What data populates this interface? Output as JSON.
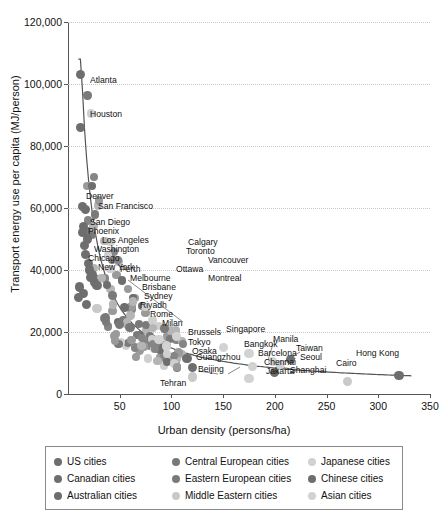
{
  "chart_data": {
    "type": "scatter",
    "title": "",
    "xlabel": "Urban density (persons/ha)",
    "ylabel": "Transport energy use per capita (MJ/person)",
    "xlim": [
      0,
      350
    ],
    "ylim": [
      0,
      120000
    ],
    "xticks": [
      "50",
      "100",
      "150",
      "200",
      "250",
      "300",
      "350"
    ],
    "xtick_values": [
      50,
      100,
      150,
      200,
      250,
      300,
      350
    ],
    "yticks": [
      "0",
      "20,000",
      "40,000",
      "60,000",
      "80,000",
      "100,000",
      "120,000"
    ],
    "ytick_values": [
      0,
      20000,
      40000,
      60000,
      80000,
      100000,
      120000
    ],
    "grid": "horizontal-dotted",
    "legend_position": "below-plot",
    "trendline": "decaying power curve from (10, 105000) to (330, 5500)",
    "series": [
      {
        "name": "US cities",
        "color": "#6e6e6e",
        "points": [
          {
            "label": "Atlanta",
            "x": 12,
            "y": 103000
          },
          {
            "label": "Houston",
            "x": 12,
            "y": 86000
          },
          {
            "label": "Denver",
            "x": 14,
            "y": 60500
          },
          {
            "label": "San Francisco",
            "x": 17,
            "y": 59500
          },
          {
            "label": "San Diego",
            "x": 15,
            "y": 54000
          },
          {
            "label": "Phoenix",
            "x": 14,
            "y": 52000
          },
          {
            "label": "Los Angeles",
            "x": 19,
            "y": 50000
          },
          {
            "label": "Washington",
            "x": 16,
            "y": 48000
          },
          {
            "label": "Chicago",
            "x": 17,
            "y": 45000
          },
          {
            "label": "New York",
            "x": 20,
            "y": 42000
          }
        ]
      },
      {
        "name": "Canadian cities",
        "color": "#6e6e6e",
        "points": [
          {
            "label": "Calgary",
            "x": 21,
            "y": 40000
          },
          {
            "label": "Toronto",
            "x": 24,
            "y": 38500
          },
          {
            "label": "Vancouver",
            "x": 22,
            "y": 37500
          },
          {
            "label": "Ottawa",
            "x": 26,
            "y": 36000
          },
          {
            "label": "Montreal",
            "x": 28,
            "y": 35000
          }
        ]
      },
      {
        "name": "Australian cities",
        "color": "#6e6e6e",
        "points": [
          {
            "label": "Perth",
            "x": 11,
            "y": 34500
          },
          {
            "label": "Melbourne",
            "x": 15,
            "y": 32500
          },
          {
            "label": "Brisbane",
            "x": 10,
            "y": 31000
          },
          {
            "label": "Sydney",
            "x": 18,
            "y": 29000
          }
        ]
      },
      {
        "name": "Central European cities",
        "color": "#787878",
        "points": [
          {
            "label": "Rome",
            "x": 36,
            "y": 24500
          },
          {
            "label": "Milan",
            "x": 50,
            "y": 22500
          },
          {
            "label": "Brussels",
            "x": 60,
            "y": 21500
          }
        ]
      },
      {
        "name": "Eastern European cities",
        "color": "#7a7a7a",
        "points": []
      },
      {
        "name": "Middle Eastern cities",
        "color": "#c9c9c9",
        "points": [
          {
            "label": "Riyadh",
            "x": 28,
            "y": 27500
          },
          {
            "label": "Tehran",
            "x": 120,
            "y": 5500
          },
          {
            "label": "Cairo",
            "x": 270,
            "y": 4000
          }
        ]
      },
      {
        "name": "Japanese cities",
        "color": "#d2d2d2",
        "points": [
          {
            "label": "Tokyo",
            "x": 88,
            "y": 17500
          },
          {
            "label": "Osaka",
            "x": 95,
            "y": 15500
          }
        ]
      },
      {
        "name": "Chinese cities",
        "color": "#6e6e6e",
        "points": [
          {
            "label": "Guangzhou",
            "x": 115,
            "y": 11500
          },
          {
            "label": "Beijing",
            "x": 120,
            "y": 8500
          },
          {
            "label": "Shanghai",
            "x": 200,
            "y": 7000
          },
          {
            "label": "Hong Kong",
            "x": 320,
            "y": 6000
          },
          {
            "label": "Taiwan",
            "x": 215,
            "y": 11000
          }
        ]
      },
      {
        "name": "Asian cities",
        "color": "#d2d2d2",
        "points": [
          {
            "label": "Singapore",
            "x": 105,
            "y": 18500
          },
          {
            "label": "Bangkok",
            "x": 150,
            "y": 15000
          },
          {
            "label": "Barcelona",
            "x": 175,
            "y": 13000
          },
          {
            "label": "Chennai",
            "x": 178,
            "y": 9000
          },
          {
            "label": "Jakarta",
            "x": 175,
            "y": 5000
          },
          {
            "label": "Manila",
            "x": 198,
            "y": 10500
          },
          {
            "label": "Seoul",
            "x": 205,
            "y": 9500
          }
        ]
      }
    ],
    "cluster_note": "dense unlabeled cluster of mid/low-density cities between 20-110 persons/ha and 5,000-30,000 MJ/person"
  },
  "legend": {
    "items": [
      {
        "label": "US cities",
        "color": "#6e6e6e"
      },
      {
        "label": "Central European cities",
        "color": "#787878"
      },
      {
        "label": "Japanese cities",
        "color": "#d2d2d2"
      },
      {
        "label": "Canadian cities",
        "color": "#6e6e6e"
      },
      {
        "label": "Eastern European cities",
        "color": "#7a7a7a"
      },
      {
        "label": "Chinese cities",
        "color": "#6e6e6e"
      },
      {
        "label": "Australian cities",
        "color": "#6e6e6e"
      },
      {
        "label": "Middle Eastern cities",
        "color": "#c9c9c9"
      },
      {
        "label": "Asian cities",
        "color": "#d2d2d2"
      }
    ]
  }
}
